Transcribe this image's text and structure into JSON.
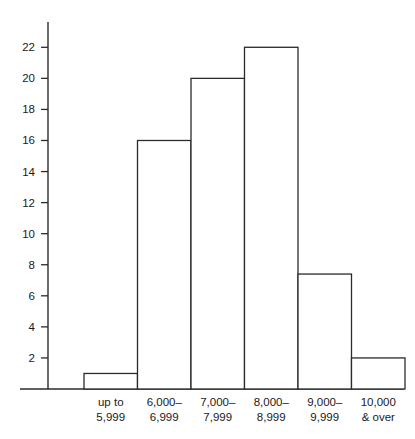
{
  "chart_data": {
    "type": "bar",
    "title": "",
    "subtitle": "",
    "xlabel": "",
    "ylabel": "",
    "categories": [
      "up to\n5,999",
      "6,000–\n6,999",
      "7,000–\n7,999",
      "8,000–\n8,999",
      "9,000–\n9,999",
      "10,000\n& over"
    ],
    "category_lines": [
      [
        "up to",
        "5,999"
      ],
      [
        "6,000–",
        "6,999"
      ],
      [
        "7,000–",
        "7,999"
      ],
      [
        "8,000–",
        "8,999"
      ],
      [
        "9,000–",
        "9,999"
      ],
      [
        "10,000",
        "& over"
      ]
    ],
    "values": [
      1,
      16,
      20,
      22,
      7.4,
      2
    ],
    "ylim": [
      0,
      23.5
    ],
    "yticks": [
      2,
      4,
      6,
      8,
      10,
      12,
      14,
      16,
      18,
      20,
      22
    ],
    "ytick_labels": [
      "2",
      "4",
      "6",
      "8",
      "10",
      "12",
      "14",
      "16",
      "18",
      "20",
      "22"
    ],
    "grid": false,
    "legend": null,
    "bar_style": "histogram-adjacent",
    "colors": {
      "bar_fill": "#ffffff",
      "bar_stroke": "#2b2b2b",
      "axis": "#2b2b2b",
      "text": "#1a1a1a",
      "background": "#ffffff"
    }
  }
}
